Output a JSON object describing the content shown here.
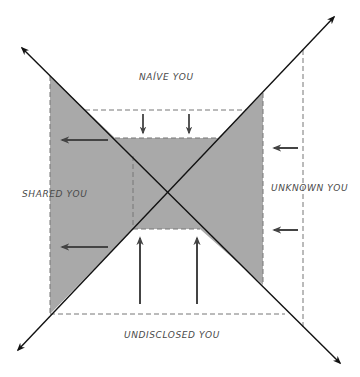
{
  "diagram": {
    "labels": {
      "naive": "NAÍVE YOU",
      "shared": "SHARED YOU",
      "unknown": "UNKNOWN YOU",
      "undisclosed": "UNDISCLOSED YOU"
    },
    "colors": {
      "shade": "#a9a9a9",
      "line": "#111111",
      "dash": "#777777",
      "arrow": "#444444",
      "text": "#4a4a4a",
      "background": "#ffffff"
    },
    "arrows": {
      "left_pointing": 4,
      "down_pointing": 2,
      "up_pointing": 2
    }
  }
}
